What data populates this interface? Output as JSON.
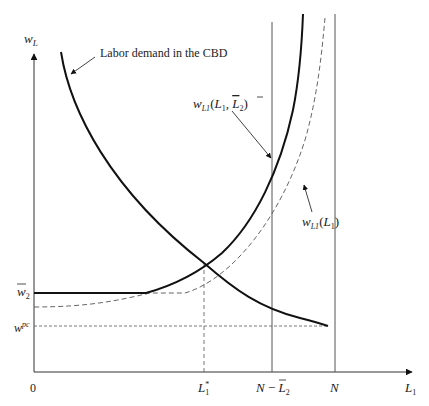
{
  "diagram": {
    "y_axis_label": "w",
    "y_axis_label_sub": "L",
    "x_axis_label": "L",
    "x_axis_label_sub": "1",
    "origin_label": "0",
    "annotations": {
      "labor_demand": "Labor demand in the CBD",
      "supply_with_L2bar": {
        "w": "w",
        "sub": "L1",
        "args_open": "(",
        "arg1": "L",
        "arg1_sub": "1",
        "comma": ", ",
        "arg2": "L",
        "arg2_sub": "2",
        "args_close": ")"
      },
      "supply_free": {
        "w": "w",
        "sub": "L1",
        "args_open": "(",
        "arg1": "L",
        "arg1_sub": "1",
        "args_close": ")"
      }
    },
    "y_ticks": {
      "w2bar": {
        "base": "w",
        "sub": "2"
      },
      "wpc": {
        "base": "w",
        "sup": "pc"
      }
    },
    "x_ticks": {
      "L1star": {
        "base": "L",
        "sub": "1",
        "sup": "*"
      },
      "N_minus_L2bar": {
        "n": "N",
        "minus": " − ",
        "base": "L",
        "sub": "2"
      },
      "N": "N"
    },
    "colors": {
      "curve": "#111111",
      "axis": "#333333",
      "guide": "#555555"
    }
  }
}
